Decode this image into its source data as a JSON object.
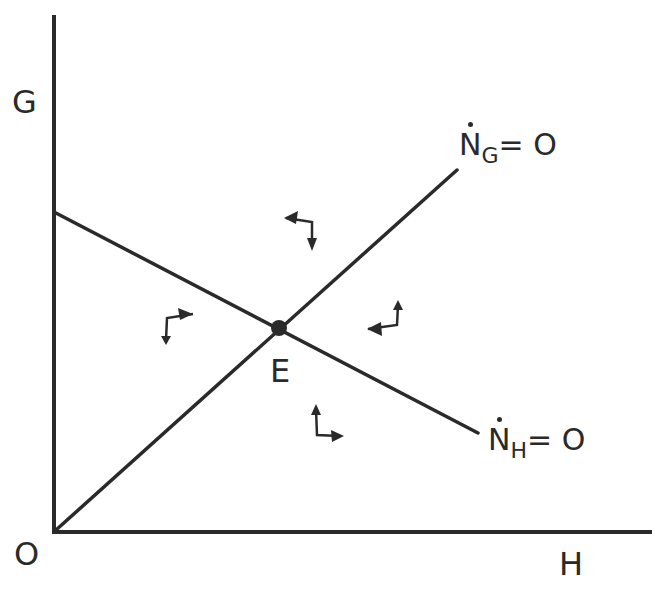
{
  "diagram": {
    "type": "phase-diagram",
    "axes": {
      "y_label": "G",
      "x_label": "H",
      "origin_label": "O"
    },
    "curves": [
      {
        "id": "NG",
        "symbol": "N",
        "subscript": "G",
        "equals": "= O",
        "description": "upward sloping locus from origin"
      },
      {
        "id": "NH",
        "symbol": "N",
        "subscript": "H",
        "equals": "= O",
        "description": "downward sloping locus from G-axis intercept"
      }
    ],
    "equilibrium": {
      "label": "E"
    },
    "direction_arrows": [
      {
        "region": "top",
        "horizontal": "left",
        "vertical": "down"
      },
      {
        "region": "left",
        "horizontal": "right",
        "vertical": "down"
      },
      {
        "region": "right",
        "horizontal": "left",
        "vertical": "up"
      },
      {
        "region": "bottom",
        "horizontal": "right",
        "vertical": "up"
      }
    ],
    "colors": {
      "ink": "#2a2a2a",
      "background": "#ffffff"
    }
  }
}
